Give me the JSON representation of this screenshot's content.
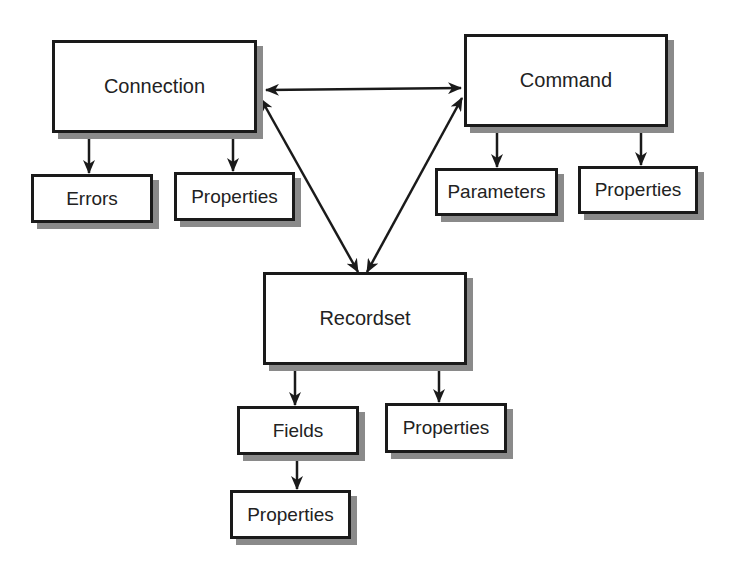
{
  "diagram": {
    "colors": {
      "line": "#1a1a1a",
      "shadow": "#8a8a8a",
      "box_fill": "#ffffff",
      "text": "#222222"
    },
    "nodes": {
      "connection": {
        "label": "Connection",
        "x": 52,
        "y": 40,
        "w": 205,
        "h": 93
      },
      "command": {
        "label": "Command",
        "x": 464,
        "y": 34,
        "w": 204,
        "h": 93
      },
      "recordset": {
        "label": "Recordset",
        "x": 263,
        "y": 272,
        "w": 204,
        "h": 93
      },
      "connection_errors": {
        "label": "Errors",
        "x": 31,
        "y": 174,
        "w": 122,
        "h": 49
      },
      "connection_properties": {
        "label": "Properties",
        "x": 174,
        "y": 172,
        "w": 121,
        "h": 49
      },
      "command_parameters": {
        "label": "Parameters",
        "x": 435,
        "y": 168,
        "w": 123,
        "h": 48
      },
      "command_properties": {
        "label": "Properties",
        "x": 578,
        "y": 166,
        "w": 120,
        "h": 48
      },
      "recordset_fields": {
        "label": "Fields",
        "x": 237,
        "y": 406,
        "w": 122,
        "h": 49
      },
      "recordset_properties": {
        "label": "Properties",
        "x": 385,
        "y": 403,
        "w": 122,
        "h": 50
      },
      "fields_properties": {
        "label": "Properties",
        "x": 230,
        "y": 490,
        "w": 121,
        "h": 49
      }
    },
    "edges": [
      {
        "from": "connection",
        "to": "command",
        "type": "bidirectional"
      },
      {
        "from": "connection",
        "to": "recordset",
        "type": "bidirectional"
      },
      {
        "from": "command",
        "to": "recordset",
        "type": "bidirectional"
      },
      {
        "from": "connection",
        "to": "connection_errors",
        "type": "directed"
      },
      {
        "from": "connection",
        "to": "connection_properties",
        "type": "directed"
      },
      {
        "from": "command",
        "to": "command_parameters",
        "type": "directed"
      },
      {
        "from": "command",
        "to": "command_properties",
        "type": "directed"
      },
      {
        "from": "recordset",
        "to": "recordset_fields",
        "type": "directed"
      },
      {
        "from": "recordset",
        "to": "recordset_properties",
        "type": "directed"
      },
      {
        "from": "recordset_fields",
        "to": "fields_properties",
        "type": "directed"
      }
    ]
  }
}
